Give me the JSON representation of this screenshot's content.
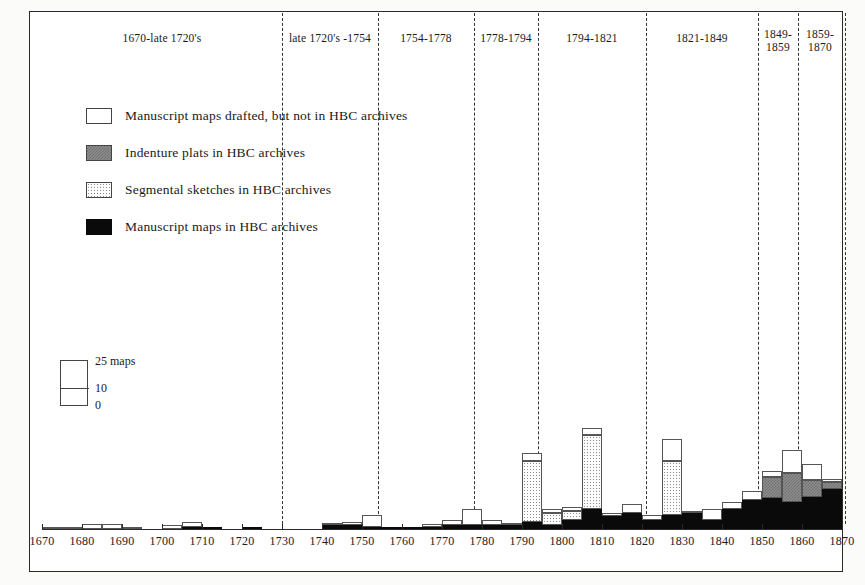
{
  "chart_data": {
    "type": "bar",
    "title": "",
    "xlabel": "",
    "ylabel": "maps",
    "xlim": [
      1670,
      1870
    ],
    "ylim": [
      0,
      60
    ],
    "grid": false,
    "bin_width_years": 5,
    "scale_key": {
      "unit_label": "25 maps",
      "mid_label": "10",
      "zero_label": "0",
      "values": [
        0,
        10,
        25
      ]
    },
    "legend": {
      "position": "upper-left",
      "entries": [
        {
          "key": "drafted_not_archived",
          "label": "Manuscript maps drafted, but not in HBC archives",
          "fill": "white"
        },
        {
          "key": "indenture_plats",
          "label": "Indenture plats in HBC archives",
          "fill": "grey-checker"
        },
        {
          "key": "segmental_sketches",
          "label": "Segmental sketches in HBC archives",
          "fill": "dotted"
        },
        {
          "key": "manuscript_archived",
          "label": "Manuscript maps in HBC archives",
          "fill": "black"
        }
      ]
    },
    "tick_labels": [
      1670,
      1680,
      1690,
      1700,
      1710,
      1720,
      1730,
      1740,
      1750,
      1760,
      1770,
      1780,
      1790,
      1800,
      1810,
      1820,
      1830,
      1840,
      1850,
      1860,
      1870
    ],
    "periods": [
      {
        "label": "1670-late 1720's",
        "start": 1670,
        "end": 1730
      },
      {
        "label": "late 1720's -1754",
        "start": 1730,
        "end": 1754
      },
      {
        "label": "1754-1778",
        "start": 1754,
        "end": 1778
      },
      {
        "label": "1778-1794",
        "start": 1778,
        "end": 1794
      },
      {
        "label": "1794-1821",
        "start": 1794,
        "end": 1821
      },
      {
        "label": "1821-1849",
        "start": 1821,
        "end": 1849
      },
      {
        "label": "1849-\n1859",
        "start": 1849,
        "end": 1859
      },
      {
        "label": "1859-\n1870",
        "start": 1859,
        "end": 1870
      }
    ],
    "series_order": [
      "manuscript_archived",
      "segmental_sketches",
      "indenture_plats",
      "drafted_not_archived"
    ],
    "bins": [
      {
        "year": 1670,
        "manuscript_archived": 0,
        "segmental_sketches": 0,
        "indenture_plats": 0,
        "drafted_not_archived": 1
      },
      {
        "year": 1675,
        "manuscript_archived": 0,
        "segmental_sketches": 0,
        "indenture_plats": 0,
        "drafted_not_archived": 1
      },
      {
        "year": 1680,
        "manuscript_archived": 0,
        "segmental_sketches": 0,
        "indenture_plats": 0,
        "drafted_not_archived": 3
      },
      {
        "year": 1685,
        "manuscript_archived": 0,
        "segmental_sketches": 0,
        "indenture_plats": 0,
        "drafted_not_archived": 3
      },
      {
        "year": 1690,
        "manuscript_archived": 0,
        "segmental_sketches": 0,
        "indenture_plats": 0,
        "drafted_not_archived": 1
      },
      {
        "year": 1695,
        "manuscript_archived": 0,
        "segmental_sketches": 0,
        "indenture_plats": 0,
        "drafted_not_archived": 0
      },
      {
        "year": 1700,
        "manuscript_archived": 0,
        "segmental_sketches": 0,
        "indenture_plats": 0,
        "drafted_not_archived": 2
      },
      {
        "year": 1705,
        "manuscript_archived": 1,
        "segmental_sketches": 0,
        "indenture_plats": 0,
        "drafted_not_archived": 3
      },
      {
        "year": 1710,
        "manuscript_archived": 1,
        "segmental_sketches": 0,
        "indenture_plats": 0,
        "drafted_not_archived": 0
      },
      {
        "year": 1715,
        "manuscript_archived": 0,
        "segmental_sketches": 0,
        "indenture_plats": 0,
        "drafted_not_archived": 0
      },
      {
        "year": 1720,
        "manuscript_archived": 1,
        "segmental_sketches": 0,
        "indenture_plats": 0,
        "drafted_not_archived": 0
      },
      {
        "year": 1725,
        "manuscript_archived": 0,
        "segmental_sketches": 0,
        "indenture_plats": 0,
        "drafted_not_archived": 0
      },
      {
        "year": 1730,
        "manuscript_archived": 0,
        "segmental_sketches": 0,
        "indenture_plats": 0,
        "drafted_not_archived": 0
      },
      {
        "year": 1735,
        "manuscript_archived": 0,
        "segmental_sketches": 0,
        "indenture_plats": 0,
        "drafted_not_archived": 0
      },
      {
        "year": 1740,
        "manuscript_archived": 2,
        "segmental_sketches": 0,
        "indenture_plats": 0,
        "drafted_not_archived": 1
      },
      {
        "year": 1745,
        "manuscript_archived": 2,
        "segmental_sketches": 0,
        "indenture_plats": 0,
        "drafted_not_archived": 2
      },
      {
        "year": 1750,
        "manuscript_archived": 1,
        "segmental_sketches": 0,
        "indenture_plats": 0,
        "drafted_not_archived": 7
      },
      {
        "year": 1755,
        "manuscript_archived": 1,
        "segmental_sketches": 0,
        "indenture_plats": 0,
        "drafted_not_archived": 0
      },
      {
        "year": 1760,
        "manuscript_archived": 1,
        "segmental_sketches": 0,
        "indenture_plats": 0,
        "drafted_not_archived": 0
      },
      {
        "year": 1765,
        "manuscript_archived": 1,
        "segmental_sketches": 0,
        "indenture_plats": 0,
        "drafted_not_archived": 2
      },
      {
        "year": 1770,
        "manuscript_archived": 2,
        "segmental_sketches": 0,
        "indenture_plats": 0,
        "drafted_not_archived": 3
      },
      {
        "year": 1775,
        "manuscript_archived": 2,
        "segmental_sketches": 0,
        "indenture_plats": 0,
        "drafted_not_archived": 9
      },
      {
        "year": 1780,
        "manuscript_archived": 2,
        "segmental_sketches": 0,
        "indenture_plats": 0,
        "drafted_not_archived": 3
      },
      {
        "year": 1785,
        "manuscript_archived": 2,
        "segmental_sketches": 0,
        "indenture_plats": 0,
        "drafted_not_archived": 1
      },
      {
        "year": 1790,
        "manuscript_archived": 4,
        "segmental_sketches": 34,
        "indenture_plats": 0,
        "drafted_not_archived": 4
      },
      {
        "year": 1795,
        "manuscript_archived": 2,
        "segmental_sketches": 7,
        "indenture_plats": 0,
        "drafted_not_archived": 2
      },
      {
        "year": 1800,
        "manuscript_archived": 5,
        "segmental_sketches": 5,
        "indenture_plats": 0,
        "drafted_not_archived": 2
      },
      {
        "year": 1805,
        "manuscript_archived": 11,
        "segmental_sketches": 41,
        "indenture_plats": 0,
        "drafted_not_archived": 4
      },
      {
        "year": 1810,
        "manuscript_archived": 7,
        "segmental_sketches": 0,
        "indenture_plats": 0,
        "drafted_not_archived": 2
      },
      {
        "year": 1815,
        "manuscript_archived": 9,
        "segmental_sketches": 0,
        "indenture_plats": 0,
        "drafted_not_archived": 5
      },
      {
        "year": 1820,
        "manuscript_archived": 5,
        "segmental_sketches": 0,
        "indenture_plats": 0,
        "drafted_not_archived": 3
      },
      {
        "year": 1825,
        "manuscript_archived": 8,
        "segmental_sketches": 30,
        "indenture_plats": 0,
        "drafted_not_archived": 12
      },
      {
        "year": 1830,
        "manuscript_archived": 9,
        "segmental_sketches": 0,
        "indenture_plats": 0,
        "drafted_not_archived": 1
      },
      {
        "year": 1835,
        "manuscript_archived": 5,
        "segmental_sketches": 0,
        "indenture_plats": 0,
        "drafted_not_archived": 6
      },
      {
        "year": 1840,
        "manuscript_archived": 11,
        "segmental_sketches": 0,
        "indenture_plats": 0,
        "drafted_not_archived": 4
      },
      {
        "year": 1845,
        "manuscript_archived": 16,
        "segmental_sketches": 0,
        "indenture_plats": 0,
        "drafted_not_archived": 5
      },
      {
        "year": 1850,
        "manuscript_archived": 17,
        "segmental_sketches": 0,
        "indenture_plats": 12,
        "drafted_not_archived": 3
      },
      {
        "year": 1855,
        "manuscript_archived": 15,
        "segmental_sketches": 0,
        "indenture_plats": 16,
        "drafted_not_archived": 13
      },
      {
        "year": 1860,
        "manuscript_archived": 18,
        "segmental_sketches": 0,
        "indenture_plats": 9,
        "drafted_not_archived": 9
      },
      {
        "year": 1865,
        "manuscript_archived": 22,
        "segmental_sketches": 0,
        "indenture_plats": 4,
        "drafted_not_archived": 2
      }
    ]
  }
}
